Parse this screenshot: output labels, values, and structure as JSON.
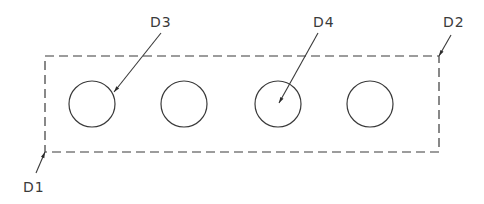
{
  "diagram": {
    "type": "cad-drawing",
    "stroke_color": "#3a3a3a",
    "background": "#ffffff",
    "rectangle": {
      "style": "dashed",
      "x": 45,
      "y": 56,
      "width": 394,
      "height": 96
    },
    "circles": [
      {
        "id": "c1",
        "cx": 92,
        "cy": 104,
        "r": 23
      },
      {
        "id": "c2",
        "cx": 184,
        "cy": 104,
        "r": 23
      },
      {
        "id": "c3",
        "cx": 278,
        "cy": 104,
        "r": 23
      },
      {
        "id": "c4",
        "cx": 370,
        "cy": 104,
        "r": 23
      }
    ],
    "labels": [
      {
        "id": "D1",
        "text": "D1",
        "x": 23,
        "y": 192,
        "leader": {
          "x1": 36,
          "y1": 173,
          "x2": 45,
          "y2": 152
        }
      },
      {
        "id": "D2",
        "text": "D2",
        "x": 443,
        "y": 27,
        "leader": {
          "x1": 451,
          "y1": 35,
          "x2": 439,
          "y2": 56
        }
      },
      {
        "id": "D3",
        "text": "D3",
        "x": 150,
        "y": 27,
        "leader": {
          "x1": 161,
          "y1": 33,
          "x2": 114,
          "y2": 92
        }
      },
      {
        "id": "D4",
        "text": "D4",
        "x": 313,
        "y": 27,
        "leader": {
          "x1": 318,
          "y1": 33,
          "x2": 279,
          "y2": 103
        }
      }
    ]
  }
}
